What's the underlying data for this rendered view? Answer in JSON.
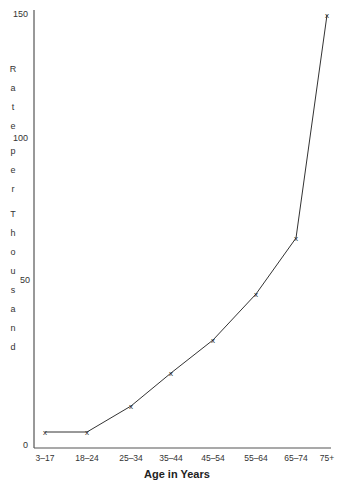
{
  "chart_data": {
    "type": "line",
    "title": "",
    "xlabel": "Age in Years",
    "ylabel": "Rate per Thousand",
    "categories": [
      "3–17",
      "18–24",
      "25–34",
      "35–44",
      "45–54",
      "55–64",
      "65–74",
      "75+"
    ],
    "series": [
      {
        "name": "Rate per Thousand",
        "values": [
          4,
          4,
          12,
          22,
          32,
          46,
          65,
          150
        ],
        "marker": "x"
      }
    ],
    "yticks": [
      "0",
      "50",
      "100",
      "150"
    ],
    "ylim": [
      0,
      150
    ],
    "grid": false,
    "legend": "none"
  },
  "axis": {
    "y_ticks": [
      {
        "label": "150",
        "y": 15
      },
      {
        "label": "100",
        "y": 139
      },
      {
        "label": "50",
        "y": 281
      },
      {
        "label": "0",
        "y": 446
      }
    ],
    "y_label_letters": [
      "R",
      "a",
      "t",
      "e",
      "",
      "p",
      "e",
      "r",
      "",
      "T",
      "h",
      "o",
      "u",
      "s",
      "a",
      "n",
      "d"
    ],
    "x_label": "Age in Years"
  },
  "colors": {
    "line": "#333333",
    "axis": "#333333",
    "text": "#222222"
  }
}
